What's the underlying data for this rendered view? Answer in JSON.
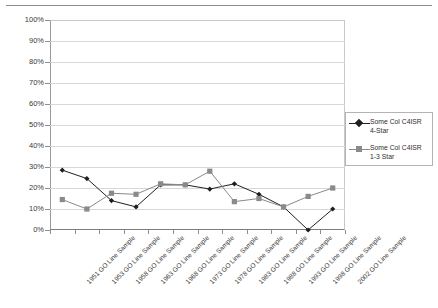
{
  "chart_data": {
    "type": "line",
    "title": "",
    "xlabel": "",
    "ylabel": "",
    "ylim": [
      0,
      100
    ],
    "ytick_labels": [
      "100%",
      "90%",
      "80%",
      "70%",
      "60%",
      "50%",
      "40%",
      "30%",
      "20%",
      "10%",
      "0%"
    ],
    "ytick_values": [
      100,
      90,
      80,
      70,
      60,
      50,
      40,
      30,
      20,
      10,
      0
    ],
    "grid": true,
    "legend_position": "right",
    "categories": [
      "1951 GO Line Sample",
      "1953 GO Line Sample",
      "1958 GO Line Sample",
      "1963 GO Line Sample",
      "1968 GO Line Sample",
      "1973 GO Line Sample",
      "1978 GO Line Sample",
      "1983 GO Line Sample",
      "1988 GO Line Sample",
      "1993 GO Line Sample",
      "1998 GO Line Sample",
      "2002 GO Line Sample"
    ],
    "series": [
      {
        "name": "Some Col C4ISR 4-Star",
        "color": "#1f1f1f",
        "marker": "diamond",
        "values": [
          28.5,
          24.5,
          14.0,
          11.0,
          21.5,
          21.5,
          19.5,
          22.0,
          17.0,
          11.0,
          0.0,
          10.0
        ]
      },
      {
        "name": "Some Col C4ISR 1-3 Star",
        "color": "#8a8a8a",
        "marker": "square",
        "values": [
          14.5,
          10.0,
          17.5,
          17.0,
          22.0,
          21.5,
          28.0,
          13.5,
          15.0,
          11.0,
          16.0,
          20.0
        ]
      }
    ]
  },
  "legend": {
    "entries": [
      {
        "line1": "Some Col C4ISR",
        "line2": "4-Star"
      },
      {
        "line1": "Some Col C4ISR",
        "line2": "1-3 Star"
      }
    ]
  }
}
